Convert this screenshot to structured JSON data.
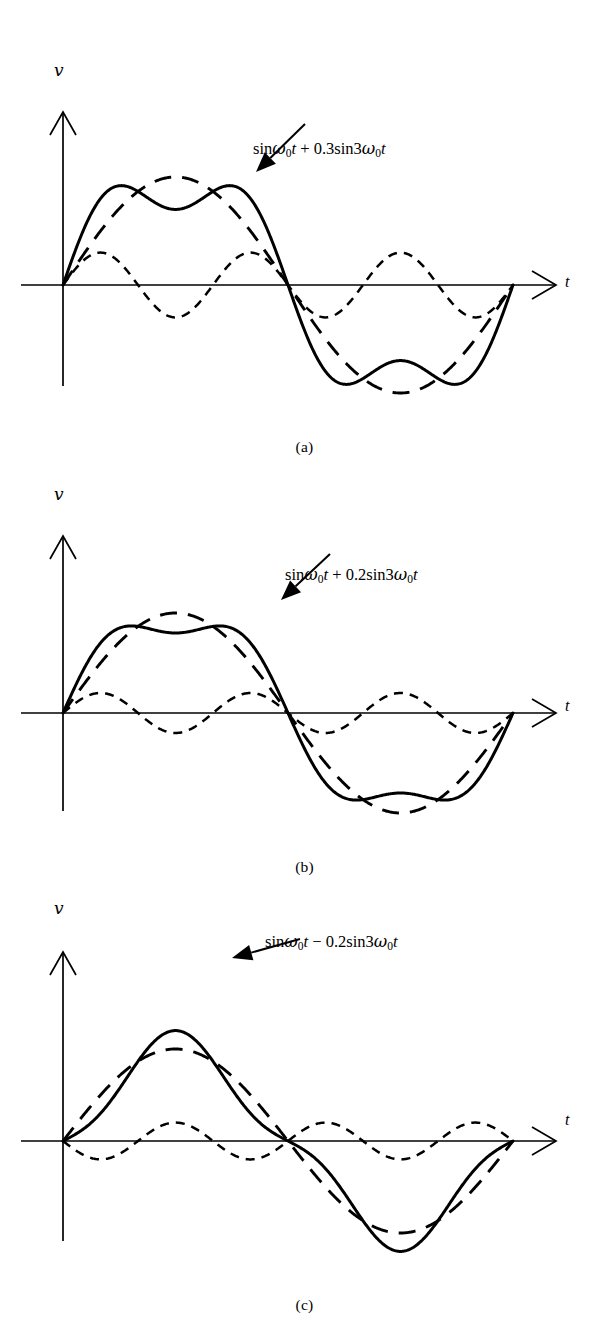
{
  "figure": {
    "axes": {
      "y_label": "v",
      "x_label": "t"
    }
  },
  "panels": [
    {
      "id": "a",
      "caption": "(a)",
      "label_prefix": "sin",
      "label": "sinω0t + 0.3sin3ω0t",
      "label_parts": {
        "fundamental": "sinω0t",
        "operator": "+",
        "harmonic": "0.3sin3ω0t"
      },
      "harmonic_coefficient": 0.3,
      "harmonic_sign": "+"
    },
    {
      "id": "b",
      "caption": "(b)",
      "label_prefix": "sin",
      "label": "sinω0t + 0.2sin3ω0t",
      "label_parts": {
        "fundamental": "sinω0t",
        "operator": "+",
        "harmonic": "0.2sin3ω0t"
      },
      "harmonic_coefficient": 0.2,
      "harmonic_sign": "+"
    },
    {
      "id": "c",
      "caption": "(c)",
      "label_prefix": "sin",
      "label": "sinω0t − 0.2sin3ω0t",
      "label_parts": {
        "fundamental": "sinω0t",
        "operator": "−",
        "harmonic": "0.2sin3ω0t"
      },
      "harmonic_coefficient": 0.2,
      "harmonic_sign": "−"
    }
  ],
  "chart_data": [
    {
      "type": "line",
      "panel": "a",
      "title": "sinω0t + 0.3sin3ω0t",
      "xlabel": "t",
      "ylabel": "v",
      "xlim": [
        0,
        6.283185307
      ],
      "ylim": [
        -1.3,
        1.3
      ],
      "grid": false,
      "legend": "none",
      "x_cycles": 1,
      "series": [
        {
          "name": "fundamental",
          "style": "long-dash",
          "formula": "sin(w0 t)",
          "amplitude": 1.0,
          "harmonic_order": 1,
          "x": [
            0,
            0.3927,
            0.7854,
            1.1781,
            1.5708,
            1.9635,
            2.3562,
            2.7489,
            3.1416,
            3.5343,
            3.927,
            4.3197,
            4.7124,
            5.1051,
            5.4978,
            5.8905,
            6.2832
          ],
          "values": [
            0,
            0.3827,
            0.7071,
            0.9239,
            1.0,
            0.9239,
            0.7071,
            0.3827,
            0,
            -0.3827,
            -0.7071,
            -0.9239,
            -1.0,
            -0.9239,
            -0.7071,
            -0.3827,
            0
          ]
        },
        {
          "name": "third-harmonic",
          "style": "short-dash",
          "formula": "0.3 sin(3 w0 t)",
          "amplitude": 0.3,
          "harmonic_order": 3,
          "x": [
            0,
            0.3927,
            0.7854,
            1.1781,
            1.5708,
            1.9635,
            2.3562,
            2.7489,
            3.1416,
            3.5343,
            3.927,
            4.3197,
            4.7124,
            5.1051,
            5.4978,
            5.8905,
            6.2832
          ],
          "values": [
            0,
            0.2772,
            0.2121,
            -0.1148,
            -0.3,
            -0.1148,
            0.2121,
            0.2772,
            0,
            -0.2772,
            -0.2121,
            0.1148,
            0.3,
            0.1148,
            -0.2121,
            -0.2772,
            0
          ]
        },
        {
          "name": "sum",
          "style": "solid",
          "formula": "sin(w0 t) + 0.3 sin(3 w0 t)",
          "x": [
            0,
            0.3927,
            0.7854,
            1.1781,
            1.5708,
            1.9635,
            2.3562,
            2.7489,
            3.1416,
            3.5343,
            3.927,
            4.3197,
            4.7124,
            5.1051,
            5.4978,
            5.8905,
            6.2832
          ],
          "values": [
            0,
            0.6599,
            0.9192,
            0.8091,
            0.7,
            0.8091,
            0.9192,
            0.6599,
            0,
            -0.6599,
            -0.9192,
            -0.8091,
            -0.7,
            -0.8091,
            -0.9192,
            -0.6599,
            0
          ]
        }
      ]
    },
    {
      "type": "line",
      "panel": "b",
      "title": "sinω0t + 0.2sin3ω0t",
      "xlabel": "t",
      "ylabel": "v",
      "xlim": [
        0,
        6.283185307
      ],
      "ylim": [
        -1.3,
        1.3
      ],
      "grid": false,
      "legend": "none",
      "x_cycles": 1,
      "series": [
        {
          "name": "fundamental",
          "style": "long-dash",
          "formula": "sin(w0 t)",
          "amplitude": 1.0,
          "harmonic_order": 1,
          "x": [
            0,
            0.3927,
            0.7854,
            1.1781,
            1.5708,
            1.9635,
            2.3562,
            2.7489,
            3.1416,
            3.5343,
            3.927,
            4.3197,
            4.7124,
            5.1051,
            5.4978,
            5.8905,
            6.2832
          ],
          "values": [
            0,
            0.3827,
            0.7071,
            0.9239,
            1.0,
            0.9239,
            0.7071,
            0.3827,
            0,
            -0.3827,
            -0.7071,
            -0.9239,
            -1.0,
            -0.9239,
            -0.7071,
            -0.3827,
            0
          ]
        },
        {
          "name": "third-harmonic",
          "style": "short-dash",
          "formula": "0.2 sin(3 w0 t)",
          "amplitude": 0.2,
          "harmonic_order": 3,
          "x": [
            0,
            0.3927,
            0.7854,
            1.1781,
            1.5708,
            1.9635,
            2.3562,
            2.7489,
            3.1416,
            3.5343,
            3.927,
            4.3197,
            4.7124,
            5.1051,
            5.4978,
            5.8905,
            6.2832
          ],
          "values": [
            0,
            0.1848,
            0.1414,
            -0.0765,
            -0.2,
            -0.0765,
            0.1414,
            0.1848,
            0,
            -0.1848,
            -0.1414,
            0.0765,
            0.2,
            0.0765,
            -0.1414,
            -0.1848,
            0
          ]
        },
        {
          "name": "sum",
          "style": "solid",
          "formula": "sin(w0 t) + 0.2 sin(3 w0 t)",
          "x": [
            0,
            0.3927,
            0.7854,
            1.1781,
            1.5708,
            1.9635,
            2.3562,
            2.7489,
            3.1416,
            3.5343,
            3.927,
            4.3197,
            4.7124,
            5.1051,
            5.4978,
            5.8905,
            6.2832
          ],
          "values": [
            0,
            0.5675,
            0.8485,
            0.8474,
            0.8,
            0.8474,
            0.8485,
            0.5675,
            0,
            -0.5675,
            -0.8485,
            -0.8474,
            -0.8,
            -0.8474,
            -0.8485,
            -0.5675,
            0
          ]
        }
      ]
    },
    {
      "type": "line",
      "panel": "c",
      "title": "sinω0t − 0.2sin3ω0t",
      "xlabel": "t",
      "ylabel": "v",
      "xlim": [
        0,
        6.283185307
      ],
      "ylim": [
        -1.3,
        1.3
      ],
      "grid": false,
      "legend": "none",
      "x_cycles": 1,
      "series": [
        {
          "name": "fundamental",
          "style": "long-dash",
          "formula": "sin(w0 t)",
          "amplitude": 1.0,
          "harmonic_order": 1,
          "x": [
            0,
            0.3927,
            0.7854,
            1.1781,
            1.5708,
            1.9635,
            2.3562,
            2.7489,
            3.1416,
            3.5343,
            3.927,
            4.3197,
            4.7124,
            5.1051,
            5.4978,
            5.8905,
            6.2832
          ],
          "values": [
            0,
            0.3827,
            0.7071,
            0.9239,
            1.0,
            0.9239,
            0.7071,
            0.3827,
            0,
            -0.3827,
            -0.7071,
            -0.9239,
            -1.0,
            -0.9239,
            -0.7071,
            -0.3827,
            0
          ]
        },
        {
          "name": "third-harmonic",
          "style": "short-dash",
          "formula": "-0.2 sin(3 w0 t)",
          "amplitude": -0.2,
          "harmonic_order": 3,
          "x": [
            0,
            0.3927,
            0.7854,
            1.1781,
            1.5708,
            1.9635,
            2.3562,
            2.7489,
            3.1416,
            3.5343,
            3.927,
            4.3197,
            4.7124,
            5.1051,
            5.4978,
            5.8905,
            6.2832
          ],
          "values": [
            0,
            -0.1848,
            -0.1414,
            0.0765,
            0.2,
            0.0765,
            -0.1414,
            -0.1848,
            0,
            0.1848,
            0.1414,
            -0.0765,
            -0.2,
            -0.0765,
            0.1414,
            0.1848,
            0
          ]
        },
        {
          "name": "sum",
          "style": "solid",
          "formula": "sin(w0 t) - 0.2 sin(3 w0 t)",
          "x": [
            0,
            0.3927,
            0.7854,
            1.1781,
            1.5708,
            1.9635,
            2.3562,
            2.7489,
            3.1416,
            3.5343,
            3.927,
            4.3197,
            4.7124,
            5.1051,
            5.4978,
            5.8905,
            6.2832
          ],
          "values": [
            0,
            0.1979,
            0.5657,
            1.0004,
            1.2,
            1.0004,
            0.5657,
            0.1979,
            0,
            -0.1979,
            -0.5657,
            -1.0004,
            -1.2,
            -1.0004,
            -0.5657,
            -0.1979,
            0
          ]
        }
      ]
    }
  ]
}
